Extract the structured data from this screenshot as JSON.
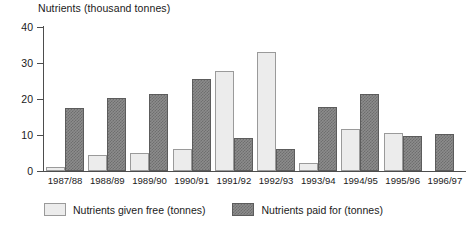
{
  "chart_data": {
    "type": "bar",
    "title": "Nutrients (thousand tonnes)",
    "xlabel": "",
    "ylabel": "Nutrients (thousand tonnes)",
    "ylim": [
      0,
      40
    ],
    "yticks": [
      0,
      10,
      20,
      30,
      40
    ],
    "grid": false,
    "legend_position": "bottom-left",
    "categories": [
      "1987/88",
      "1988/89",
      "1989/90",
      "1990/91",
      "1991/92",
      "1992/93",
      "1993/94",
      "1994/95",
      "1995/96",
      "1996/97"
    ],
    "series": [
      {
        "name": "Nutrients given free (tonnes)",
        "color": "#ececec",
        "values": [
          1.0,
          4.5,
          5.0,
          6.0,
          27.8,
          33.0,
          2.3,
          11.8,
          10.5,
          0
        ]
      },
      {
        "name": "Nutrients paid for (tonnes)",
        "color": "#8c8c8c",
        "values": [
          17.5,
          20.3,
          21.3,
          25.5,
          9.2,
          6.0,
          17.8,
          21.5,
          9.6,
          10.4
        ]
      }
    ]
  }
}
